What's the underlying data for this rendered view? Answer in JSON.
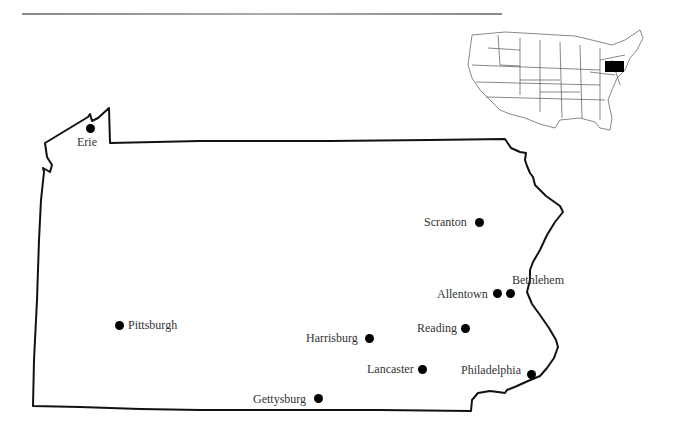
{
  "map": {
    "state": "Pennsylvania",
    "outline_color": "#111111",
    "dot_color": "#000000",
    "inset": {
      "highlight_state": "Pennsylvania",
      "highlight_color": "#000000"
    },
    "cities": [
      {
        "name": "Erie",
        "x": 90,
        "y": 128,
        "label_x": 77,
        "label_y": 135
      },
      {
        "name": "Scranton",
        "x": 479,
        "y": 222,
        "label_x": 424,
        "label_y": 215
      },
      {
        "name": "Bethlehem",
        "x": 510,
        "y": 293,
        "label_x": 512,
        "label_y": 273
      },
      {
        "name": "Allentown",
        "x": 497,
        "y": 293,
        "label_x": 437,
        "label_y": 287
      },
      {
        "name": "Pittsburgh",
        "x": 119,
        "y": 325,
        "label_x": 128,
        "label_y": 318
      },
      {
        "name": "Reading",
        "x": 465,
        "y": 328,
        "label_x": 417,
        "label_y": 321
      },
      {
        "name": "Harrisburg",
        "x": 369,
        "y": 338,
        "label_x": 306,
        "label_y": 331
      },
      {
        "name": "Lancaster",
        "x": 422,
        "y": 369,
        "label_x": 367,
        "label_y": 362
      },
      {
        "name": "Philadelphia",
        "x": 531,
        "y": 374,
        "label_x": 461,
        "label_y": 363
      },
      {
        "name": "Gettysburg",
        "x": 318,
        "y": 398,
        "label_x": 253,
        "label_y": 392
      }
    ]
  }
}
